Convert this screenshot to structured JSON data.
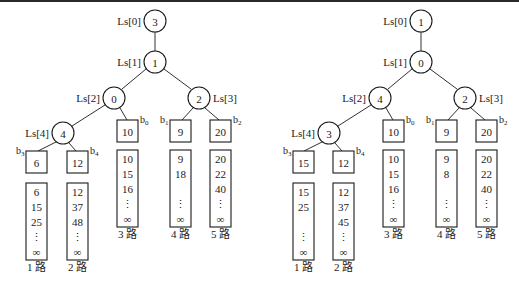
{
  "colors": {
    "stroke": "#1a1a1a",
    "background": "#ffffff",
    "topline": "#2a2a2a"
  },
  "trees": [
    {
      "id": "left",
      "internal_nodes": [
        {
          "label": "Ls[0]",
          "value": "3",
          "cx": 155,
          "cy": 21,
          "label_side": "left"
        },
        {
          "label": "Ls[1]",
          "value": "1",
          "cx": 155,
          "cy": 62,
          "label_side": "left"
        },
        {
          "label": "Ls[2]",
          "value": "0",
          "cx": 114,
          "cy": 98,
          "label_side": "left"
        },
        {
          "label": "Ls[3]",
          "value": "2",
          "cx": 199,
          "cy": 98,
          "label_side": "right"
        },
        {
          "label": "Ls[4]",
          "value": "4",
          "cx": 63,
          "cy": 133,
          "label_side": "left"
        }
      ],
      "edges": [
        [
          155,
          32,
          155,
          51
        ],
        [
          146,
          69,
          122,
          89
        ],
        [
          164,
          69,
          191,
          89
        ],
        [
          105,
          105,
          72,
          126
        ],
        [
          120,
          108,
          127,
          120
        ],
        [
          193,
          108,
          182,
          120
        ],
        [
          205,
          108,
          219,
          120
        ],
        [
          56,
          142,
          38,
          151
        ],
        [
          69,
          143,
          76,
          151
        ]
      ],
      "leaves": [
        {
          "b": "b",
          "sub": "0",
          "value": "10",
          "x": 117,
          "y": 120,
          "bside": "right"
        },
        {
          "b": "b",
          "sub": "1",
          "value": "9",
          "x": 170,
          "y": 120,
          "bside": "left"
        },
        {
          "b": "b",
          "sub": "2",
          "value": "20",
          "x": 210,
          "y": 120,
          "bside": "right"
        },
        {
          "b": "b",
          "sub": "3",
          "value": "6",
          "x": 26,
          "y": 151,
          "bside": "left"
        },
        {
          "b": "b",
          "sub": "4",
          "value": "12",
          "x": 67,
          "y": 151,
          "bside": "right"
        }
      ],
      "runs": [
        {
          "label": "1 路",
          "x": 26,
          "y": 183,
          "values": [
            "6",
            "15",
            "25",
            "⋮",
            "∞"
          ]
        },
        {
          "label": "2 路",
          "x": 67,
          "y": 183,
          "values": [
            "12",
            "37",
            "48",
            "⋮",
            "∞"
          ]
        },
        {
          "label": "3 路",
          "x": 117,
          "y": 150,
          "values": [
            "10",
            "15",
            "16",
            "⋮",
            "∞"
          ]
        },
        {
          "label": "4 路",
          "x": 170,
          "y": 150,
          "values": [
            "9",
            "18",
            "",
            "⋮",
            "∞"
          ]
        },
        {
          "label": "5 路",
          "x": 210,
          "y": 150,
          "values": [
            "20",
            "22",
            "40",
            "⋮",
            "∞"
          ]
        }
      ]
    },
    {
      "id": "right",
      "internal_nodes": [
        {
          "label": "Ls[0]",
          "value": "1",
          "cx": 421,
          "cy": 21,
          "label_side": "left"
        },
        {
          "label": "Ls[1]",
          "value": "0",
          "cx": 421,
          "cy": 62,
          "label_side": "left"
        },
        {
          "label": "Ls[2]",
          "value": "4",
          "cx": 380,
          "cy": 98,
          "label_side": "left"
        },
        {
          "label": "Ls[3]",
          "value": "2",
          "cx": 465,
          "cy": 98,
          "label_side": "right"
        },
        {
          "label": "Ls[4]",
          "value": "3",
          "cx": 329,
          "cy": 133,
          "label_side": "left"
        }
      ],
      "edges": [
        [
          421,
          32,
          421,
          51
        ],
        [
          412,
          69,
          388,
          89
        ],
        [
          430,
          69,
          457,
          89
        ],
        [
          371,
          105,
          338,
          126
        ],
        [
          386,
          108,
          393,
          120
        ],
        [
          459,
          108,
          448,
          120
        ],
        [
          471,
          108,
          485,
          120
        ],
        [
          322,
          142,
          304,
          151
        ],
        [
          335,
          143,
          342,
          151
        ]
      ],
      "leaves": [
        {
          "b": "b",
          "sub": "0",
          "value": "10",
          "x": 383,
          "y": 120,
          "bside": "right"
        },
        {
          "b": "b",
          "sub": "1",
          "value": "9",
          "x": 436,
          "y": 120,
          "bside": "left"
        },
        {
          "b": "b",
          "sub": "2",
          "value": "20",
          "x": 476,
          "y": 120,
          "bside": "right"
        },
        {
          "b": "b",
          "sub": "3",
          "value": "15",
          "x": 293,
          "y": 151,
          "bside": "left"
        },
        {
          "b": "b",
          "sub": "4",
          "value": "12",
          "x": 333,
          "y": 151,
          "bside": "right"
        }
      ],
      "runs": [
        {
          "label": "1 路",
          "x": 293,
          "y": 183,
          "values": [
            "15",
            "25",
            "",
            "⋮",
            "∞"
          ]
        },
        {
          "label": "2 路",
          "x": 333,
          "y": 183,
          "values": [
            "12",
            "37",
            "45",
            "⋮",
            "∞"
          ]
        },
        {
          "label": "3 路",
          "x": 383,
          "y": 150,
          "values": [
            "10",
            "15",
            "16",
            "⋮",
            "∞"
          ]
        },
        {
          "label": "4 路",
          "x": 436,
          "y": 150,
          "values": [
            "9",
            "8",
            "",
            "⋮",
            "∞"
          ]
        },
        {
          "label": "5 路",
          "x": 476,
          "y": 150,
          "values": [
            "20",
            "22",
            "40",
            "⋮",
            "∞"
          ]
        }
      ]
    }
  ]
}
